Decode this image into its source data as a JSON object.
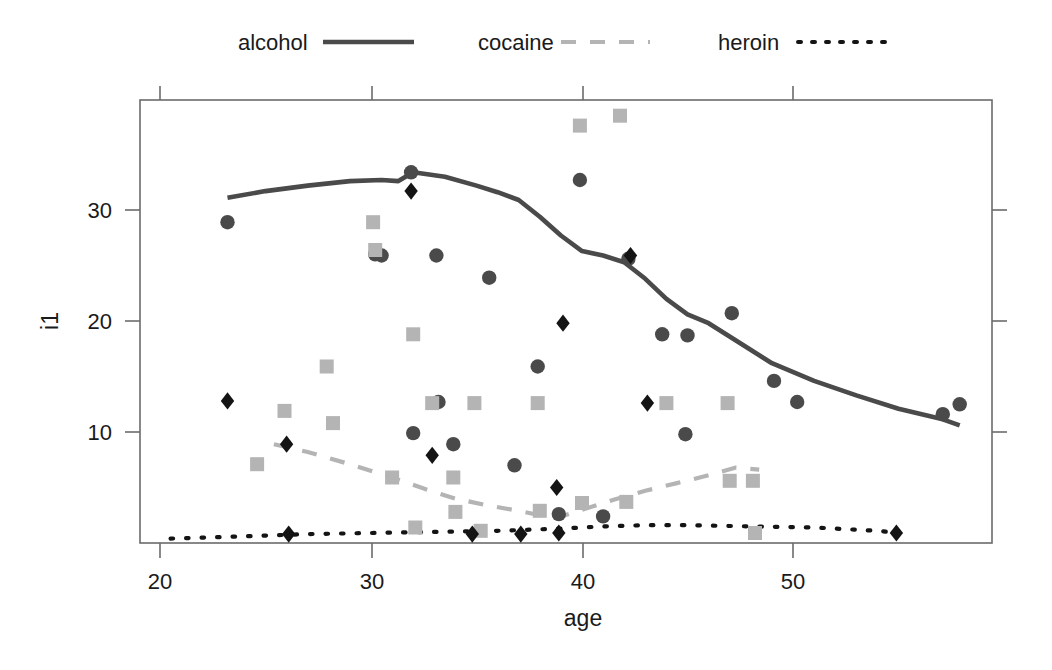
{
  "chart_data": {
    "type": "scatter",
    "title": "",
    "xlabel": "age",
    "ylabel": "i1",
    "xlim": [
      18.5,
      58.8
    ],
    "ylim": [
      0,
      39.5
    ],
    "xticks": [
      20,
      30,
      40,
      50
    ],
    "yticks": [
      10,
      20,
      30
    ],
    "grid": false,
    "legend_position": "top",
    "legend": [
      {
        "name": "alcohol",
        "style": "solid",
        "color": "#4a4a4a",
        "marker": "circle"
      },
      {
        "name": "cocaine",
        "style": "dashed",
        "color": "#b4b4b4",
        "marker": "square"
      },
      {
        "name": "heroin",
        "style": "dotted",
        "color": "#141414",
        "marker": "diamond"
      }
    ],
    "series": [
      {
        "name": "alcohol",
        "marker": "circle",
        "color": "#4a4a4a",
        "points": [
          [
            23.2,
            28.9
          ],
          [
            30.2,
            26.0
          ],
          [
            30.5,
            25.9
          ],
          [
            31.9,
            33.4
          ],
          [
            32.0,
            9.9
          ],
          [
            33.1,
            25.9
          ],
          [
            33.2,
            12.7
          ],
          [
            33.9,
            8.9
          ],
          [
            35.6,
            23.9
          ],
          [
            36.8,
            7.0
          ],
          [
            37.9,
            15.9
          ],
          [
            38.9,
            2.6
          ],
          [
            39.9,
            32.7
          ],
          [
            41.0,
            2.4
          ],
          [
            42.2,
            25.6
          ],
          [
            43.8,
            18.8
          ],
          [
            44.9,
            9.8
          ],
          [
            45.0,
            18.7
          ],
          [
            47.1,
            20.7
          ],
          [
            49.1,
            14.6
          ],
          [
            50.2,
            12.7
          ],
          [
            57.1,
            11.6
          ],
          [
            57.9,
            12.5
          ]
        ]
      },
      {
        "name": "cocaine",
        "marker": "square",
        "color": "#b4b4b4",
        "points": [
          [
            24.6,
            7.1
          ],
          [
            25.9,
            11.9
          ],
          [
            27.9,
            15.9
          ],
          [
            28.2,
            10.8
          ],
          [
            30.1,
            28.9
          ],
          [
            30.2,
            26.4
          ],
          [
            31.0,
            5.9
          ],
          [
            32.0,
            18.8
          ],
          [
            32.1,
            1.4
          ],
          [
            32.9,
            12.6
          ],
          [
            33.9,
            5.9
          ],
          [
            34.0,
            2.8
          ],
          [
            34.9,
            12.6
          ],
          [
            35.2,
            1.1
          ],
          [
            37.9,
            12.6
          ],
          [
            38.0,
            2.9
          ],
          [
            39.9,
            37.6
          ],
          [
            40.0,
            3.6
          ],
          [
            41.8,
            38.5
          ],
          [
            42.1,
            3.7
          ],
          [
            44.0,
            12.6
          ],
          [
            46.9,
            12.6
          ],
          [
            47.0,
            5.6
          ],
          [
            48.1,
            5.6
          ],
          [
            48.2,
            0.9
          ]
        ]
      },
      {
        "name": "heroin",
        "marker": "diamond",
        "color": "#141414",
        "points": [
          [
            23.2,
            12.8
          ],
          [
            26.0,
            8.9
          ],
          [
            26.1,
            0.8
          ],
          [
            31.9,
            31.7
          ],
          [
            32.9,
            7.9
          ],
          [
            34.8,
            0.8
          ],
          [
            37.1,
            0.8
          ],
          [
            38.8,
            5.0
          ],
          [
            38.9,
            0.9
          ],
          [
            39.1,
            19.8
          ],
          [
            42.3,
            25.9
          ],
          [
            43.1,
            12.6
          ],
          [
            54.9,
            0.9
          ]
        ]
      }
    ],
    "trend_lines": [
      {
        "name": "alcohol",
        "style": "solid",
        "color": "#4a4a4a",
        "points": [
          [
            23.2,
            31.1
          ],
          [
            25.0,
            31.7
          ],
          [
            27.0,
            32.2
          ],
          [
            29.0,
            32.6
          ],
          [
            30.5,
            32.7
          ],
          [
            31.3,
            32.6
          ],
          [
            32.0,
            33.4
          ],
          [
            33.5,
            33.0
          ],
          [
            35.0,
            32.2
          ],
          [
            36.0,
            31.6
          ],
          [
            37.0,
            30.9
          ],
          [
            38.0,
            29.4
          ],
          [
            39.0,
            27.7
          ],
          [
            40.0,
            26.3
          ],
          [
            41.0,
            25.9
          ],
          [
            42.0,
            25.3
          ],
          [
            43.0,
            23.8
          ],
          [
            44.0,
            22.0
          ],
          [
            45.0,
            20.6
          ],
          [
            46.0,
            19.8
          ],
          [
            47.5,
            18.0
          ],
          [
            49.0,
            16.2
          ],
          [
            51.0,
            14.6
          ],
          [
            53.0,
            13.3
          ],
          [
            55.0,
            12.1
          ],
          [
            57.0,
            11.2
          ],
          [
            57.9,
            10.6
          ]
        ]
      },
      {
        "name": "cocaine",
        "style": "dashed",
        "color": "#b4b4b4",
        "points": [
          [
            25.4,
            8.9
          ],
          [
            27.0,
            8.2
          ],
          [
            29.0,
            7.1
          ],
          [
            31.0,
            5.9
          ],
          [
            32.5,
            4.9
          ],
          [
            34.0,
            4.0
          ],
          [
            35.5,
            3.4
          ],
          [
            37.0,
            2.9
          ],
          [
            38.3,
            2.4
          ],
          [
            39.2,
            2.5
          ],
          [
            40.0,
            3.0
          ],
          [
            41.5,
            3.9
          ],
          [
            43.0,
            4.7
          ],
          [
            44.5,
            5.4
          ],
          [
            46.0,
            6.1
          ],
          [
            47.3,
            6.8
          ],
          [
            48.4,
            6.6
          ]
        ]
      },
      {
        "name": "heroin",
        "style": "dotted",
        "color": "#141414",
        "points": [
          [
            20.5,
            0.4
          ],
          [
            24.0,
            0.6
          ],
          [
            27.0,
            0.8
          ],
          [
            30.0,
            0.9
          ],
          [
            33.0,
            1.0
          ],
          [
            36.0,
            1.1
          ],
          [
            39.0,
            1.3
          ],
          [
            41.0,
            1.5
          ],
          [
            43.0,
            1.6
          ],
          [
            45.0,
            1.6
          ],
          [
            48.0,
            1.5
          ],
          [
            51.0,
            1.4
          ],
          [
            54.0,
            1.1
          ],
          [
            55.0,
            0.9
          ]
        ]
      }
    ]
  },
  "axes": {
    "x_title": "age",
    "y_title": "i1",
    "x_tick_labels": [
      "20",
      "30",
      "40",
      "50"
    ],
    "y_tick_labels": [
      "10",
      "20",
      "30"
    ]
  },
  "legend": {
    "items": [
      {
        "label": "alcohol",
        "key": "alcohol"
      },
      {
        "label": "cocaine",
        "key": "cocaine"
      },
      {
        "label": "heroin",
        "key": "heroin"
      }
    ]
  },
  "colors": {
    "alcohol": "#4a4a4a",
    "cocaine": "#b4b4b4",
    "heroin": "#141414",
    "frame": "#6b6b6b",
    "text": "#1a1a1a",
    "background": "#ffffff"
  }
}
